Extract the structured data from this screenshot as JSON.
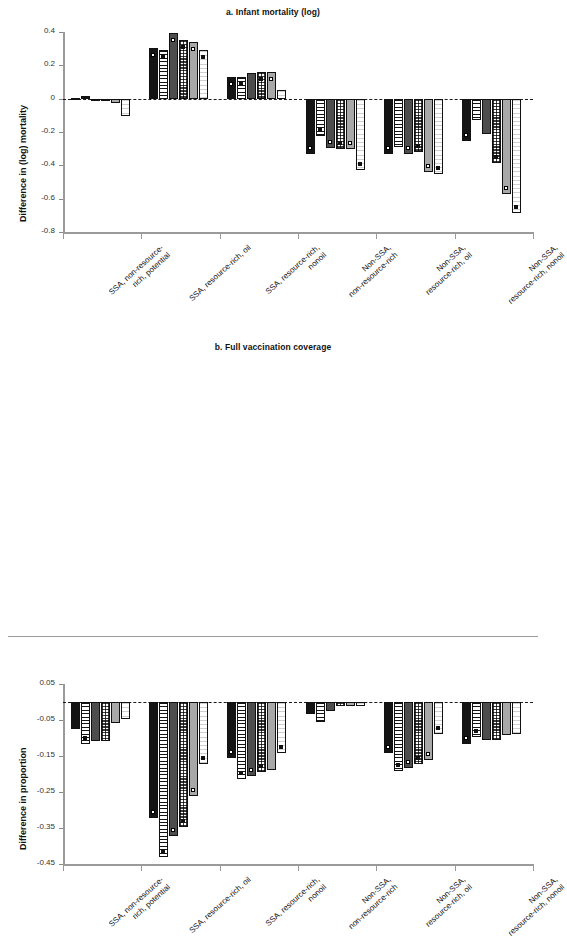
{
  "figure": {
    "width": 546,
    "height": 647,
    "background": "#ffffff",
    "ink": "#141414"
  },
  "series_styles": [
    {
      "key": "s1",
      "fill": "f-black",
      "label": "series-1-solid-black"
    },
    {
      "key": "s2",
      "fill": "f-hstripe",
      "label": "series-2-horizontal-stripe"
    },
    {
      "key": "s3",
      "fill": "f-dgray",
      "label": "series-3-dark-gray"
    },
    {
      "key": "s4",
      "fill": "f-check",
      "label": "series-4-checkered"
    },
    {
      "key": "s5",
      "fill": "f-lgray",
      "label": "series-5-light-gray"
    },
    {
      "key": "s6",
      "fill": "f-wstripe",
      "label": "series-6-white-fine-stripe"
    }
  ],
  "categories": [
    "SSA, non-resource-\nrich, potential",
    "SSA, resource-rich, oil",
    "SSA, resource-rich,\nnonoil",
    "Non-SSA,\nnon-resource-rich",
    "Non-SSA,\nresource-rich, oil",
    "Non-SSA,\nresource-rich, nonoil"
  ],
  "chart_data": [
    {
      "type": "bar",
      "panel": "a",
      "title": "a. Infant mortality (log)",
      "xlabel": "",
      "ylabel": "Difference in (log) mortality",
      "ylim": [
        -0.8,
        0.4
      ],
      "yticks": [
        0.4,
        0.2,
        0,
        -0.2,
        -0.4,
        -0.6,
        -0.8
      ],
      "ytick_labels": [
        "0.4",
        "0.2",
        "0",
        "-0.2",
        "-0.4",
        "-0.6",
        "-0.8"
      ],
      "grid": false,
      "legend": "none",
      "zero_reference_line": true,
      "categories": [
        "SSA, non-resource-rich, potential",
        "SSA, resource-rich, oil",
        "SSA, resource-rich, nonoil",
        "Non-SSA, non-resource-rich",
        "Non-SSA, resource-rich, oil",
        "Non-SSA, resource-rich, nonoil"
      ],
      "groups": [
        {
          "category": "SSA, non-resource-rich, potential",
          "bars": [
            {
              "series": "s1",
              "value": 0.004,
              "significant": false
            },
            {
              "series": "s2",
              "value": 0.014,
              "significant": false
            },
            {
              "series": "s3",
              "value": -0.012,
              "significant": false
            },
            {
              "series": "s4",
              "value": -0.004,
              "significant": false
            },
            {
              "series": "s5",
              "value": -0.025,
              "significant": false
            },
            {
              "series": "s6",
              "value": -0.105,
              "significant": false
            }
          ]
        },
        {
          "category": "SSA, resource-rich, oil",
          "bars": [
            {
              "series": "s1",
              "value": 0.305,
              "significant": true
            },
            {
              "series": "s2",
              "value": 0.293,
              "significant": true
            },
            {
              "series": "s3",
              "value": 0.397,
              "significant": true
            },
            {
              "series": "s4",
              "value": 0.352,
              "significant": true
            },
            {
              "series": "s5",
              "value": 0.34,
              "significant": true
            },
            {
              "series": "s6",
              "value": 0.292,
              "significant": true
            }
          ]
        },
        {
          "category": "SSA, resource-rich, nonoil",
          "bars": [
            {
              "series": "s1",
              "value": 0.13,
              "significant": true
            },
            {
              "series": "s2",
              "value": 0.132,
              "significant": true
            },
            {
              "series": "s3",
              "value": 0.157,
              "significant": false
            },
            {
              "series": "s4",
              "value": 0.163,
              "significant": true
            },
            {
              "series": "s5",
              "value": 0.16,
              "significant": true
            },
            {
              "series": "s6",
              "value": 0.052,
              "significant": false
            }
          ]
        },
        {
          "category": "Non-SSA, non-resource-rich",
          "bars": [
            {
              "series": "s1",
              "value": -0.332,
              "significant": true
            },
            {
              "series": "s2",
              "value": -0.222,
              "significant": true
            },
            {
              "series": "s3",
              "value": -0.295,
              "significant": true
            },
            {
              "series": "s4",
              "value": -0.302,
              "significant": true
            },
            {
              "series": "s5",
              "value": -0.3,
              "significant": true
            },
            {
              "series": "s6",
              "value": -0.428,
              "significant": true
            }
          ]
        },
        {
          "category": "Non-SSA, resource-rich, oil",
          "bars": [
            {
              "series": "s1",
              "value": -0.332,
              "significant": true
            },
            {
              "series": "s2",
              "value": -0.29,
              "significant": false
            },
            {
              "series": "s3",
              "value": -0.33,
              "significant": true
            },
            {
              "series": "s4",
              "value": -0.318,
              "significant": true
            },
            {
              "series": "s5",
              "value": -0.442,
              "significant": true
            },
            {
              "series": "s6",
              "value": -0.45,
              "significant": true
            }
          ]
        },
        {
          "category": "Non-SSA, resource-rich, nonoil",
          "bars": [
            {
              "series": "s1",
              "value": -0.255,
              "significant": true
            },
            {
              "series": "s2",
              "value": -0.128,
              "significant": false
            },
            {
              "series": "s3",
              "value": -0.213,
              "significant": false
            },
            {
              "series": "s4",
              "value": -0.385,
              "significant": true
            },
            {
              "series": "s5",
              "value": -0.572,
              "significant": true
            },
            {
              "series": "s6",
              "value": -0.688,
              "significant": true
            }
          ]
        }
      ]
    },
    {
      "type": "bar",
      "panel": "b",
      "title": "b. Full vaccination coverage",
      "xlabel": "",
      "ylabel": "Difference in proportion",
      "ylim": [
        -0.45,
        0.05
      ],
      "yticks": [
        0.05,
        -0.05,
        -0.15,
        -0.25,
        -0.35,
        -0.45
      ],
      "ytick_labels": [
        "0.05",
        "-0.05",
        "-0.15",
        "-0.25",
        "-0.35",
        "-0.45"
      ],
      "grid": false,
      "legend": "none",
      "zero_reference_line": true,
      "categories": [
        "SSA, non-resource-rich, potential",
        "SSA, resource-rich, oil",
        "SSA, resource-rich, nonoil",
        "Non-SSA, non-resource-rich",
        "Non-SSA, resource-rich, oil",
        "Non-SSA, resource-rich, nonoil"
      ],
      "groups": [
        {
          "category": "SSA, non-resource-rich, potential",
          "bars": [
            {
              "series": "s1",
              "value": -0.074,
              "significant": false
            },
            {
              "series": "s2",
              "value": -0.118,
              "significant": true
            },
            {
              "series": "s3",
              "value": -0.108,
              "significant": false
            },
            {
              "series": "s4",
              "value": -0.108,
              "significant": false
            },
            {
              "series": "s5",
              "value": -0.058,
              "significant": false
            },
            {
              "series": "s6",
              "value": -0.048,
              "significant": false
            }
          ]
        },
        {
          "category": "SSA, resource-rich, oil",
          "bars": [
            {
              "series": "s1",
              "value": -0.322,
              "significant": true
            },
            {
              "series": "s2",
              "value": -0.43,
              "significant": true
            },
            {
              "series": "s3",
              "value": -0.372,
              "significant": true
            },
            {
              "series": "s4",
              "value": -0.348,
              "significant": true
            },
            {
              "series": "s5",
              "value": -0.262,
              "significant": true
            },
            {
              "series": "s6",
              "value": -0.172,
              "significant": true
            }
          ]
        },
        {
          "category": "SSA, resource-rich, nonoil",
          "bars": [
            {
              "series": "s1",
              "value": -0.155,
              "significant": true
            },
            {
              "series": "s2",
              "value": -0.215,
              "significant": true
            },
            {
              "series": "s3",
              "value": -0.205,
              "significant": true
            },
            {
              "series": "s4",
              "value": -0.195,
              "significant": true
            },
            {
              "series": "s5",
              "value": -0.19,
              "significant": false
            },
            {
              "series": "s6",
              "value": -0.142,
              "significant": true
            }
          ]
        },
        {
          "category": "Non-SSA, non-resource-rich",
          "bars": [
            {
              "series": "s1",
              "value": -0.032,
              "significant": false
            },
            {
              "series": "s2",
              "value": -0.055,
              "significant": false
            },
            {
              "series": "s3",
              "value": -0.024,
              "significant": false
            },
            {
              "series": "s4",
              "value": -0.012,
              "significant": false
            },
            {
              "series": "s5",
              "value": -0.01,
              "significant": false
            },
            {
              "series": "s6",
              "value": -0.01,
              "significant": false
            }
          ]
        },
        {
          "category": "Non-SSA, resource-rich, oil",
          "bars": [
            {
              "series": "s1",
              "value": -0.142,
              "significant": true
            },
            {
              "series": "s2",
              "value": -0.192,
              "significant": true
            },
            {
              "series": "s3",
              "value": -0.182,
              "significant": true
            },
            {
              "series": "s4",
              "value": -0.172,
              "significant": true
            },
            {
              "series": "s5",
              "value": -0.162,
              "significant": true
            },
            {
              "series": "s6",
              "value": -0.088,
              "significant": true
            }
          ]
        },
        {
          "category": "Non-SSA, resource-rich, nonoil",
          "bars": [
            {
              "series": "s1",
              "value": -0.118,
              "significant": true
            },
            {
              "series": "s2",
              "value": -0.097,
              "significant": true
            },
            {
              "series": "s3",
              "value": -0.105,
              "significant": false
            },
            {
              "series": "s4",
              "value": -0.105,
              "significant": false
            },
            {
              "series": "s5",
              "value": -0.092,
              "significant": false
            },
            {
              "series": "s6",
              "value": -0.088,
              "significant": false
            }
          ]
        }
      ]
    }
  ]
}
